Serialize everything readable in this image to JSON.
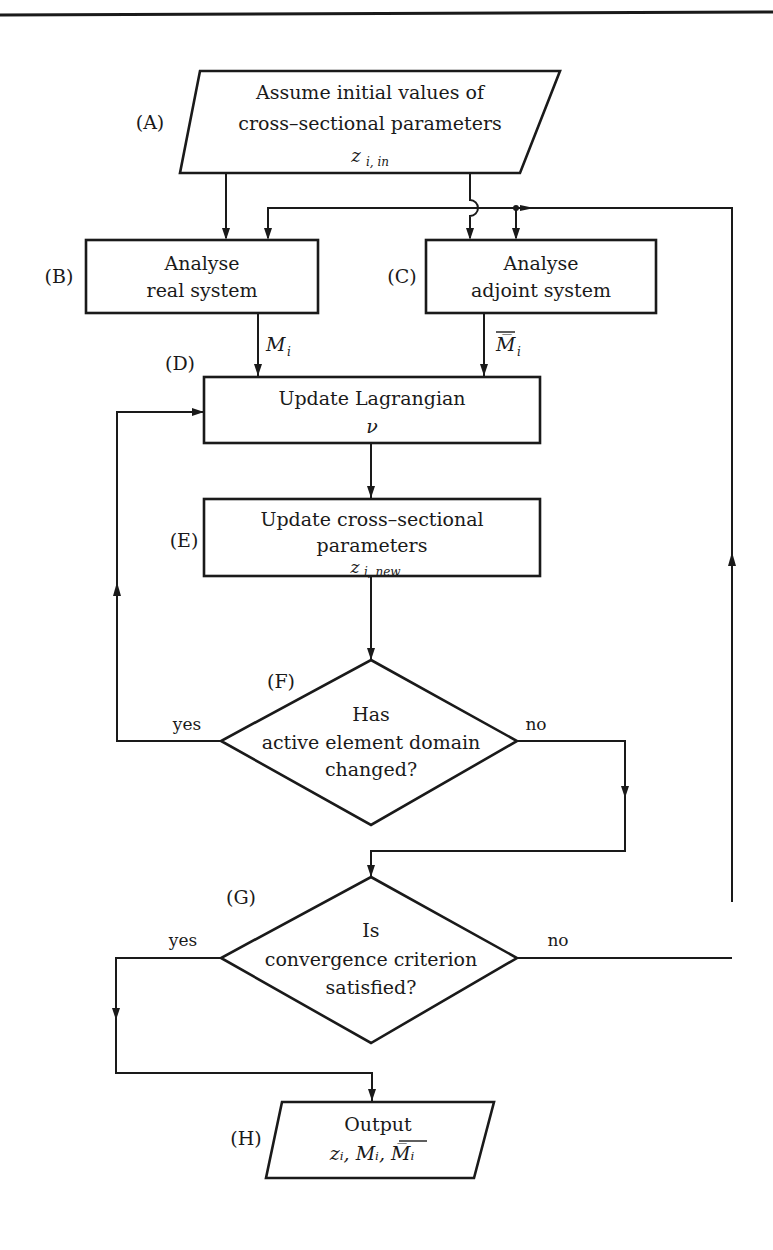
{
  "diagram": {
    "type": "flowchart",
    "nodes": {
      "A": {
        "tag": "(A)",
        "shape": "parallelogram",
        "line1": "Assume initial values of",
        "line2": "cross–sectional parameters",
        "var": "z",
        "var_sub": "i, in"
      },
      "B": {
        "tag": "(B)",
        "shape": "rectangle",
        "line1": "Analyse",
        "line2": "real system"
      },
      "C": {
        "tag": "(C)",
        "shape": "rectangle",
        "line1": "Analyse",
        "line2": "adjoint system"
      },
      "D": {
        "tag": "(D)",
        "shape": "rectangle",
        "line1": "Update Lagrangian",
        "var": "ν"
      },
      "E": {
        "tag": "(E)",
        "shape": "rectangle",
        "line1": "Update cross–sectional",
        "line2": "parameters",
        "var": "z",
        "var_sub": "i, new"
      },
      "F": {
        "tag": "(F)",
        "shape": "diamond",
        "line1": "Has",
        "line2": "active element domain",
        "line3": "changed?"
      },
      "G": {
        "tag": "(G)",
        "shape": "diamond",
        "line1": "Is",
        "line2": "convergence criterion",
        "line3": "satisfied?"
      },
      "H": {
        "tag": "(H)",
        "shape": "parallelogram",
        "line1": "Output",
        "vars": "zᵢ,  Mᵢ,  M̅ᵢ"
      }
    },
    "edge_labels": {
      "B_to_D": "M",
      "B_to_D_sub": "i",
      "C_to_D": "M̅",
      "C_to_D_sub": "i",
      "F_yes": "yes",
      "F_no": "no",
      "G_yes": "yes",
      "G_no": "no"
    },
    "edges": [
      {
        "from": "A",
        "to": "B"
      },
      {
        "from": "A",
        "to": "C"
      },
      {
        "from": "B",
        "to": "D",
        "label": "M_i"
      },
      {
        "from": "C",
        "to": "D",
        "label": "M̅_i"
      },
      {
        "from": "D",
        "to": "E"
      },
      {
        "from": "E",
        "to": "F"
      },
      {
        "from": "F",
        "to": "D",
        "label": "yes"
      },
      {
        "from": "F",
        "to": "G",
        "label": "no"
      },
      {
        "from": "G",
        "to": "H",
        "label": "yes"
      },
      {
        "from": "G",
        "to": "B",
        "label": "no"
      },
      {
        "from": "G",
        "to": "C",
        "label": "no"
      }
    ]
  }
}
